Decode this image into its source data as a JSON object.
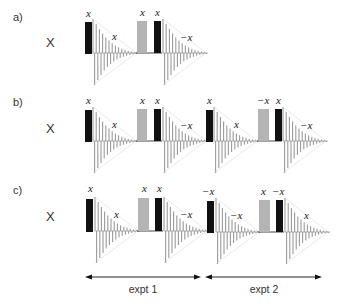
{
  "colors": {
    "hard_pulse": "#111111",
    "soft_pulse": "#b4b4b4",
    "fid": "#9a9a9a",
    "baseline": "#444444",
    "text": "#333333"
  },
  "rows": [
    {
      "label": "a)",
      "receiver_phase_label": "X",
      "experiments": [
        {
          "pulse1_phase": "x",
          "fid1_phase": "x",
          "soft_pulse_phase": "x",
          "pulse2_phase": "x",
          "fid2_phase": "−x"
        }
      ]
    },
    {
      "label": "b)",
      "receiver_phase_label": "X",
      "experiments": [
        {
          "pulse1_phase": "x",
          "fid1_phase": "x",
          "soft_pulse_phase": "x",
          "pulse2_phase": "x",
          "fid2_phase": "−x"
        },
        {
          "pulse1_phase": "x",
          "fid1_phase": "x",
          "soft_pulse_phase": "−x",
          "pulse2_phase": "x",
          "fid2_phase": "−x"
        }
      ]
    },
    {
      "label": "c)",
      "receiver_phase_label": "X",
      "experiments": [
        {
          "pulse1_phase": "x",
          "fid1_phase": "x",
          "soft_pulse_phase": "x",
          "pulse2_phase": "x",
          "fid2_phase": "−x"
        },
        {
          "pulse1_phase": "−x",
          "fid1_phase": "−x",
          "soft_pulse_phase": "x",
          "pulse2_phase": "−x",
          "fid2_phase": "x"
        }
      ]
    }
  ],
  "spans": [
    {
      "label": "expt 1"
    },
    {
      "label": "expt 2"
    }
  ]
}
